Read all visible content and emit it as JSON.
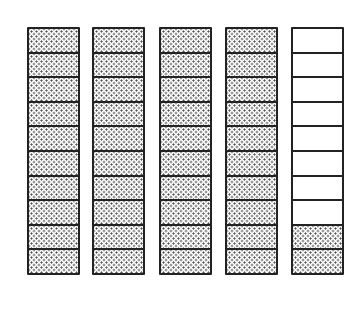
{
  "diagram": {
    "cells_per_strip": 10,
    "strips": [
      {
        "left": 27,
        "shaded": 10
      },
      {
        "left": 92,
        "shaded": 10
      },
      {
        "left": 159,
        "shaded": 10
      },
      {
        "left": 225,
        "shaded": 10
      },
      {
        "left": 291,
        "shaded": 2
      }
    ],
    "total_shaded_tenths": 42,
    "colors": {
      "line": "#222222",
      "fill_dots": "#555555",
      "background": "#ffffff"
    }
  }
}
